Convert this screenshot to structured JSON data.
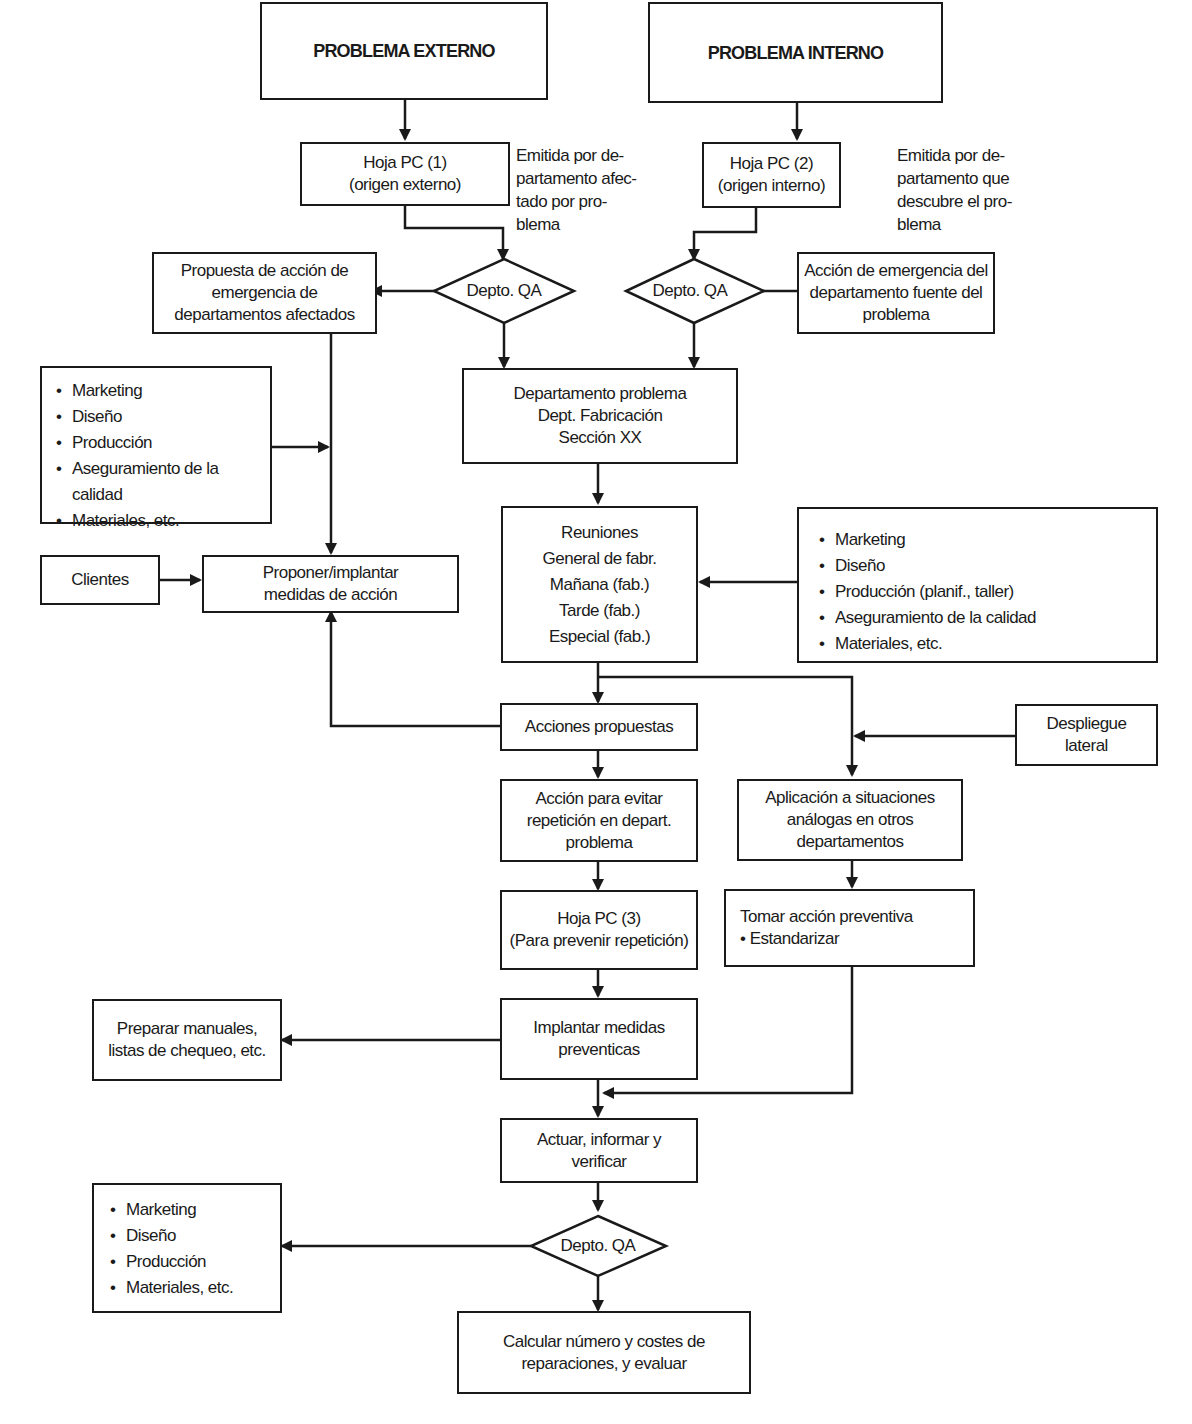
{
  "diagram": {
    "type": "flowchart",
    "nodes": {
      "problema_externo": {
        "lines": [
          "PROBLEMA EXTERNO"
        ]
      },
      "problema_interno": {
        "lines": [
          "PROBLEMA INTERNO"
        ]
      },
      "hoja_pc1": {
        "lines": [
          "Hoja PC (1)",
          "(origen externo)"
        ]
      },
      "hoja_pc2": {
        "lines": [
          "Hoja PC (2)",
          "(origen interno)"
        ]
      },
      "note_pc1": {
        "text": "Emitida por de-\npartamento afec-\ntado por pro-\nblema"
      },
      "note_pc2": {
        "text": "Emitida por de-\npartamento que\ndescubre el pro-\nblema"
      },
      "qa_left": {
        "label": "Depto. QA"
      },
      "qa_right": {
        "label": "Depto. QA"
      },
      "qa_bottom": {
        "label": "Depto. QA"
      },
      "propuesta_emergencia": {
        "lines": [
          "Propuesta de acción de",
          "emergencia de",
          "departamentos afectados"
        ]
      },
      "accion_emergencia_fuente": {
        "lines": [
          "Acción de emergencia del",
          "departamento fuente del",
          "problema"
        ]
      },
      "departamento_problema": {
        "lines": [
          "Departamento problema",
          "Dept. Fabricación",
          "Sección XX"
        ]
      },
      "lista_izq": {
        "items": [
          "Marketing",
          "Diseño",
          "Producción",
          "Aseguramiento de la calidad",
          "Materiales, etc."
        ]
      },
      "clientes": {
        "lines": [
          "Clientes"
        ]
      },
      "proponer_implantar": {
        "lines": [
          "Proponer/implantar",
          "medidas de acción"
        ]
      },
      "reuniones": {
        "lines": [
          "Reuniones",
          "General de fabr.",
          "Mañana (fab.)",
          "Tarde (fab.)",
          "Especial (fab.)"
        ]
      },
      "lista_der": {
        "items": [
          "Marketing",
          "Diseño",
          "Producción (planif., taller)",
          "Aseguramiento de la calidad",
          "Materiales, etc."
        ]
      },
      "acciones_propuestas": {
        "lines": [
          "Acciones propuestas"
        ]
      },
      "despliegue_lateral": {
        "lines": [
          "Despliegue",
          "lateral"
        ]
      },
      "accion_evitar": {
        "lines": [
          "Acción para evitar",
          "repetición en depart.",
          "problema"
        ]
      },
      "aplicacion_analogas": {
        "lines": [
          "Aplicación a situaciones",
          "análogas en otros",
          "departamentos"
        ]
      },
      "hoja_pc3": {
        "lines": [
          "Hoja PC (3)",
          "(Para prevenir repetición)"
        ]
      },
      "tomar_accion": {
        "title": "Tomar acción preventiva",
        "items": [
          "Estandarizar"
        ]
      },
      "preparar_manuales": {
        "lines": [
          "Preparar manuales,",
          "listas de chequeo, etc."
        ]
      },
      "implantar_medidas": {
        "lines": [
          "Implantar medidas",
          "preventicas"
        ]
      },
      "actuar": {
        "lines": [
          "Actuar, informar y",
          "verificar"
        ]
      },
      "lista_inf": {
        "items": [
          "Marketing",
          "Diseño",
          "Producción",
          "Materiales, etc."
        ]
      },
      "calcular": {
        "lines": [
          "Calcular número y costes de",
          "reparaciones, y evaluar"
        ]
      }
    },
    "stroke_color": "#1a1a1a",
    "background": "#ffffff"
  }
}
